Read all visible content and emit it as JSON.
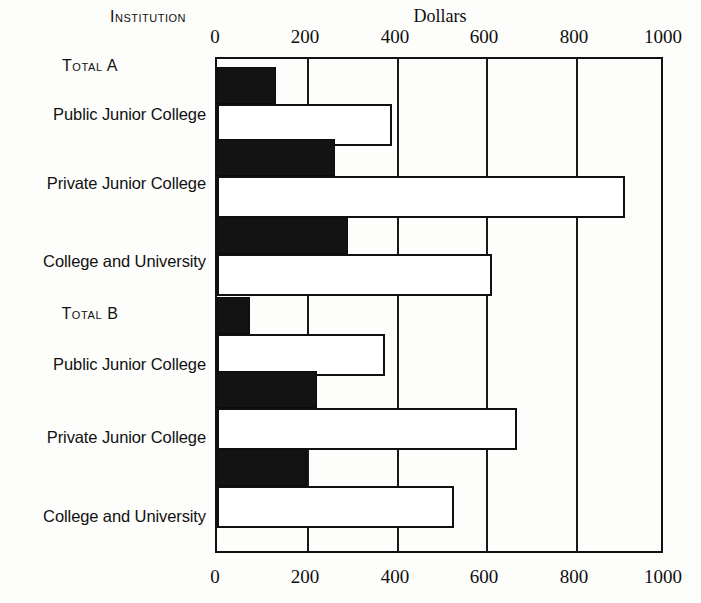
{
  "header": {
    "institution_label": "Institution",
    "unit_label": "Dollars"
  },
  "chart_data": {
    "type": "bar",
    "orientation": "horizontal",
    "title": "",
    "xlabel": "Dollars",
    "ylabel": "Institution",
    "xlim": [
      0,
      1000
    ],
    "xticks": [
      0,
      200,
      400,
      600,
      800,
      1000
    ],
    "xtick_labels": [
      "0",
      "200",
      "400",
      "600",
      "800",
      "1000"
    ],
    "xticks_top": [
      "0",
      "200",
      "400",
      "600",
      "800",
      "1000"
    ],
    "xticks_bottom": [
      "0",
      "200",
      "400",
      "600",
      "800",
      "1000"
    ],
    "grid": true,
    "legend": "none",
    "series": [
      {
        "name": "dark",
        "color": "#131313",
        "style": "filled"
      },
      {
        "name": "light",
        "color": "#ffffff",
        "style": "outlined"
      }
    ],
    "groups": [
      {
        "group_label": "Total A",
        "categories": [
          "Public Junior College",
          "Private Junior College",
          "College and University"
        ],
        "dark_values": [
          131,
          264,
          292
        ],
        "light_values": [
          391,
          911,
          614
        ]
      },
      {
        "group_label": "Total B",
        "categories": [
          "Public Junior College",
          "Private Junior College",
          "College and University"
        ],
        "dark_values": [
          74,
          223,
          201
        ],
        "light_values": [
          375,
          670,
          529
        ]
      }
    ],
    "rows": [
      {
        "group": "Total A",
        "category": "Public Junior College",
        "dark": 131,
        "light": 391
      },
      {
        "group": "Total A",
        "category": "Private Junior College",
        "dark": 264,
        "light": 911
      },
      {
        "group": "Total A",
        "category": "College and University",
        "dark": 292,
        "light": 614
      },
      {
        "group": "Total B",
        "category": "Public Junior College",
        "dark": 74,
        "light": 375
      },
      {
        "group": "Total B",
        "category": "Private Junior College",
        "dark": 223,
        "light": 670
      },
      {
        "group": "Total B",
        "category": "College and University",
        "dark": 201,
        "light": 529
      }
    ]
  },
  "axis_top": {
    "ticks": [
      {
        "label": "0",
        "x": 215
      },
      {
        "label": "200",
        "x": 305
      },
      {
        "label": "400",
        "x": 395
      },
      {
        "label": "600",
        "x": 484
      },
      {
        "label": "800",
        "x": 574
      },
      {
        "label": "1000",
        "x": 663
      }
    ]
  },
  "axis_bottom": {
    "ticks": [
      {
        "label": "0",
        "x": 215
      },
      {
        "label": "200",
        "x": 305
      },
      {
        "label": "400",
        "x": 395
      },
      {
        "label": "600",
        "x": 484
      },
      {
        "label": "800",
        "x": 574
      },
      {
        "label": "1000",
        "x": 663
      }
    ]
  },
  "left_axis": {
    "entries": [
      {
        "type": "group",
        "label": "Total A",
        "y": 57
      },
      {
        "type": "category",
        "label": "Public Junior College",
        "y": 105
      },
      {
        "type": "category",
        "label": "Private Junior College",
        "y": 174
      },
      {
        "type": "category",
        "label": "College and University",
        "y": 252
      },
      {
        "type": "group",
        "label": "Total B",
        "y": 305
      },
      {
        "type": "category",
        "label": "Public Junior College",
        "y": 355
      },
      {
        "type": "category",
        "label": "Private Junior College",
        "y": 428
      },
      {
        "type": "category",
        "label": "College and University",
        "y": 507
      }
    ]
  }
}
